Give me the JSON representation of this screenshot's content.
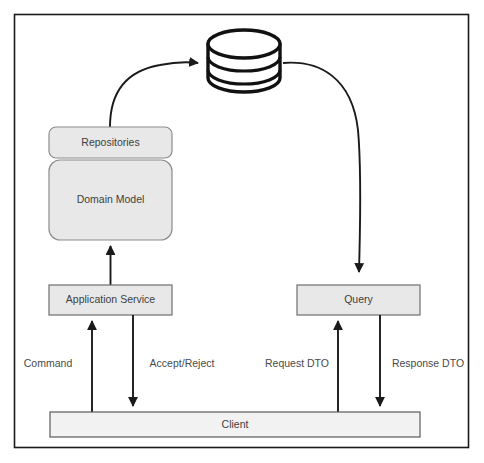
{
  "diagram": {
    "type": "architecture-flow",
    "canvas": {
      "width": 484,
      "height": 463
    },
    "frame": {
      "x": 14,
      "y": 14,
      "width": 455,
      "height": 434,
      "stroke": "#1a1a1a"
    },
    "colors": {
      "node_fill": "#e8e8e8",
      "node_stroke": "#8c8c8c",
      "client_fill": "#f2f2f2",
      "client_stroke": "#5a5a5a",
      "edge_stroke": "#1a1a1a",
      "text": "#404040",
      "background": "#ffffff"
    },
    "nodes": [
      {
        "id": "database",
        "label": "",
        "shape": "cylinder",
        "x": 207,
        "y": 28,
        "width": 73,
        "height": 65
      },
      {
        "id": "repositories",
        "label": "Repositories",
        "shape": "rounded-rect",
        "x": 49,
        "y": 127,
        "width": 123,
        "height": 31
      },
      {
        "id": "domain-model",
        "label": "Domain Model",
        "shape": "rounded-rect",
        "x": 49,
        "y": 160,
        "width": 123,
        "height": 80
      },
      {
        "id": "application-service",
        "label": "Application Service",
        "shape": "rect",
        "x": 49,
        "y": 285,
        "width": 123,
        "height": 30
      },
      {
        "id": "query",
        "label": "Query",
        "shape": "rect",
        "x": 297,
        "y": 285,
        "width": 123,
        "height": 30
      },
      {
        "id": "client",
        "label": "Client",
        "shape": "rect",
        "x": 50,
        "y": 412,
        "width": 370,
        "height": 25
      }
    ],
    "edges": [
      {
        "id": "repositories-to-database",
        "from": "repositories",
        "to": "database",
        "label": "",
        "style": "curved",
        "arrowhead": "end"
      },
      {
        "id": "database-to-query",
        "from": "database",
        "to": "query",
        "label": "",
        "style": "curved",
        "arrowhead": "end"
      },
      {
        "id": "application-service-to-domain-model",
        "from": "application-service",
        "to": "domain-model",
        "label": "",
        "style": "straight-up",
        "arrowhead": "end"
      },
      {
        "id": "client-to-application-service",
        "from": "client",
        "to": "application-service",
        "label": "Command",
        "style": "straight-up",
        "arrowhead": "end"
      },
      {
        "id": "application-service-to-client",
        "from": "application-service",
        "to": "client",
        "label": "Accept/Reject",
        "style": "straight-down",
        "arrowhead": "end"
      },
      {
        "id": "client-to-query",
        "from": "client",
        "to": "query",
        "label": "Request DTO",
        "style": "straight-up",
        "arrowhead": "end"
      },
      {
        "id": "query-to-client",
        "from": "query",
        "to": "client",
        "label": "Response DTO",
        "style": "straight-down",
        "arrowhead": "end"
      }
    ],
    "labels": {
      "repositories": "Repositories",
      "domain_model": "Domain Model",
      "application_service": "Application Service",
      "query": "Query",
      "client": "Client",
      "command": "Command",
      "accept_reject": "Accept/Reject",
      "request_dto": "Request DTO",
      "response_dto": "Response DTO"
    }
  }
}
